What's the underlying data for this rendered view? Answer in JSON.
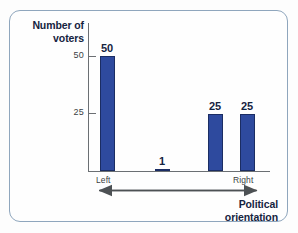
{
  "chart_data": {
    "type": "bar",
    "title": "",
    "subtitle": "",
    "xlabel": "Political orientation",
    "ylabel": "Number of voters",
    "categories": [
      "",
      "",
      "",
      ""
    ],
    "values": [
      50,
      1,
      25,
      25
    ],
    "value_labels": [
      "50",
      "1",
      "25",
      "25"
    ],
    "ylim": [
      0,
      57
    ],
    "yticks": [
      25,
      50
    ],
    "ytick_labels": [
      "25",
      "50"
    ],
    "xtick_labels": [
      "Left",
      "Right"
    ],
    "grid": false,
    "legend": null,
    "annotations": [
      {
        "name": "axis-direction-arrow",
        "text": "",
        "description": "double headed arrow from Left to Right beneath x axis"
      }
    ],
    "colors": {
      "bar_fill": "#2e4a9e",
      "bar_stroke": "#1b2d63",
      "axis": "#6b6f73",
      "label_text": "#15233f",
      "tick_text": "#3b3f44",
      "frame_border": "#8fa6bd",
      "background": "#fefefe"
    }
  },
  "axes": {
    "y_title": "Number of voters",
    "y_title_line1": "Number of",
    "y_title_line2": "voters",
    "x_title_line1": "Political",
    "x_title_line2": "orientation",
    "ytick_50": "50",
    "ytick_25": "25",
    "xlabel_left": "Left",
    "xlabel_right": "Right"
  },
  "bars": [
    {
      "id": "bar-1",
      "label": "50",
      "value": 50
    },
    {
      "id": "bar-2",
      "label": "1",
      "value": 1
    },
    {
      "id": "bar-3",
      "label": "25",
      "value": 25
    },
    {
      "id": "bar-4",
      "label": "25",
      "value": 25
    }
  ]
}
